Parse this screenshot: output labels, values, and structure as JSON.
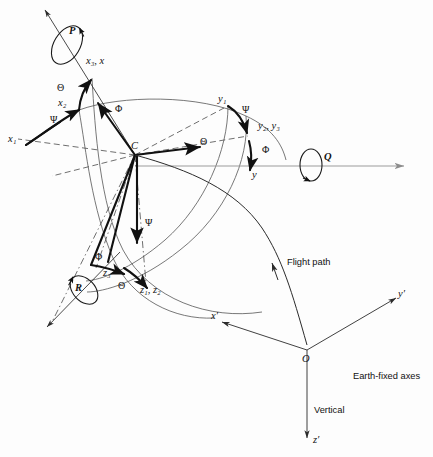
{
  "figure": {
    "background_color": "#fdfdfd",
    "ink_color": "#111111",
    "gray_axis_color": "#9b9b9b"
  },
  "body_axes": {
    "origin_label": "C",
    "x_axis_label": "x",
    "x_axis_combined_label": "x₃, x",
    "x1_label": "x₁",
    "x2_label": "x₂",
    "y_axis_label": "y",
    "y1_label": "y₁",
    "y23_label": "y₂, y₃",
    "z3_label": "z₃",
    "z12_label": "z₁, z₂"
  },
  "euler_angles": {
    "psi": "Ψ",
    "theta": "Θ",
    "phi": "Φ",
    "psi_name": "Psi",
    "theta_name": "Theta",
    "phi_name": "Phi",
    "occurrences": {
      "psi": 3,
      "theta": 3,
      "phi": 3
    }
  },
  "angular_rates": {
    "roll_rate": "P",
    "pitch_rate": "Q",
    "yaw_rate": "R"
  },
  "annotations": {
    "flight_path": "Flight path",
    "earth_fixed_axes": "Earth-fixed axes",
    "vertical": "Vertical"
  },
  "earth_axes": {
    "origin_label": "O",
    "x_prime": "x′",
    "y_prime": "y′",
    "z_prime": "z′"
  }
}
